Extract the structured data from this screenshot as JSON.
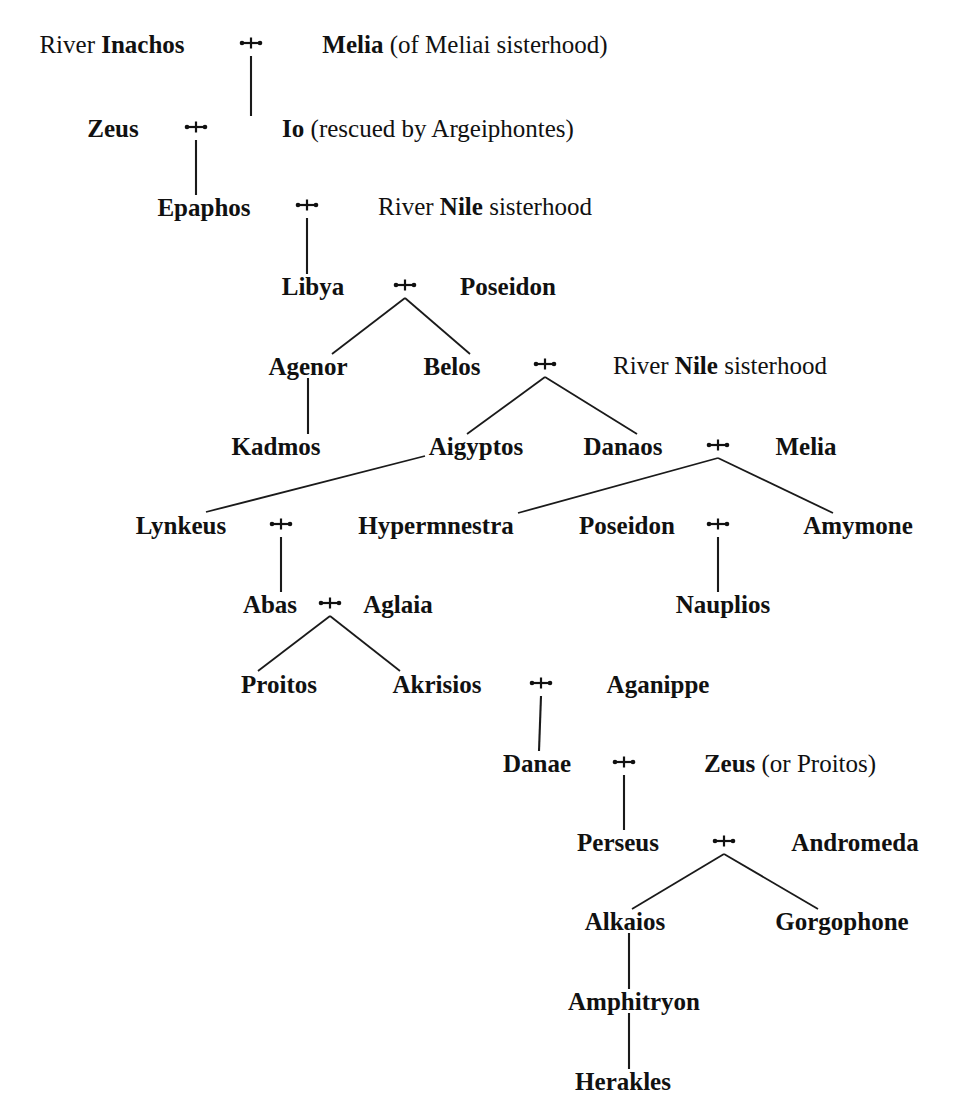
{
  "diagram": {
    "type": "family-tree",
    "marriage_symbol_name": "marriage-union-symbol",
    "ink_color": "#111111",
    "background_color": "#ffffff",
    "line_color": "#1a1a1a",
    "canvas": {
      "width": 962,
      "height": 1115
    }
  },
  "nodes": [
    {
      "id": "inachos",
      "prefix": "River ",
      "name": "Inachos",
      "suffix": "",
      "x": 112,
      "y": 44,
      "size": 25
    },
    {
      "id": "melia1",
      "prefix": "",
      "name": "Melia",
      "suffix": " (of Meliai sisterhood)",
      "x": 465,
      "y": 44,
      "size": 25
    },
    {
      "id": "zeus1",
      "prefix": "",
      "name": "Zeus",
      "suffix": "",
      "x": 113,
      "y": 128,
      "size": 25
    },
    {
      "id": "io",
      "prefix": "",
      "name": "Io",
      "suffix": " (rescued by Argeiphontes)",
      "x": 428,
      "y": 128,
      "size": 25
    },
    {
      "id": "epaphos",
      "prefix": "",
      "name": "Epaphos",
      "suffix": "",
      "x": 204,
      "y": 207,
      "size": 25
    },
    {
      "id": "nile1",
      "prefix": "River ",
      "name": "Nile",
      "suffix": " sisterhood",
      "x": 485,
      "y": 206,
      "size": 25
    },
    {
      "id": "libya",
      "prefix": "",
      "name": "Libya",
      "suffix": "",
      "x": 313,
      "y": 286,
      "size": 25
    },
    {
      "id": "poseidon1",
      "prefix": "",
      "name": "Poseidon",
      "suffix": "",
      "x": 508,
      "y": 286,
      "size": 25
    },
    {
      "id": "agenor",
      "prefix": "",
      "name": "Agenor",
      "suffix": "",
      "x": 308,
      "y": 366,
      "size": 25
    },
    {
      "id": "belos",
      "prefix": "",
      "name": "Belos",
      "suffix": "",
      "x": 452,
      "y": 366,
      "size": 25
    },
    {
      "id": "nile2",
      "prefix": "River ",
      "name": "Nile",
      "suffix": " sisterhood",
      "x": 720,
      "y": 365,
      "size": 25
    },
    {
      "id": "kadmos",
      "prefix": "",
      "name": "Kadmos",
      "suffix": "",
      "x": 276,
      "y": 446,
      "size": 25
    },
    {
      "id": "aigyptos",
      "prefix": "",
      "name": "Aigyptos",
      "suffix": "",
      "x": 476,
      "y": 446,
      "size": 25
    },
    {
      "id": "danaos",
      "prefix": "",
      "name": "Danaos",
      "suffix": "",
      "x": 623,
      "y": 446,
      "size": 25
    },
    {
      "id": "melia2",
      "prefix": "",
      "name": "Melia",
      "suffix": "",
      "x": 806,
      "y": 446,
      "size": 25
    },
    {
      "id": "lynkeus",
      "prefix": "",
      "name": "Lynkeus",
      "suffix": "",
      "x": 181,
      "y": 525,
      "size": 25
    },
    {
      "id": "hypermnestra",
      "prefix": "",
      "name": "Hypermnestra",
      "suffix": "",
      "x": 436,
      "y": 525,
      "size": 25
    },
    {
      "id": "poseidon2",
      "prefix": "",
      "name": "Poseidon",
      "suffix": "",
      "x": 627,
      "y": 525,
      "size": 25
    },
    {
      "id": "amymone",
      "prefix": "",
      "name": "Amymone",
      "suffix": "",
      "x": 858,
      "y": 525,
      "size": 25
    },
    {
      "id": "abas",
      "prefix": "",
      "name": "Abas",
      "suffix": "",
      "x": 270,
      "y": 604,
      "size": 25
    },
    {
      "id": "aglaia",
      "prefix": "",
      "name": "Aglaia",
      "suffix": "",
      "x": 398,
      "y": 604,
      "size": 25
    },
    {
      "id": "nauplios",
      "prefix": "",
      "name": "Nauplios",
      "suffix": "",
      "x": 723,
      "y": 604,
      "size": 25
    },
    {
      "id": "proitos",
      "prefix": "",
      "name": "Proitos",
      "suffix": "",
      "x": 279,
      "y": 684,
      "size": 25
    },
    {
      "id": "akrisios",
      "prefix": "",
      "name": "Akrisios",
      "suffix": "",
      "x": 437,
      "y": 684,
      "size": 25
    },
    {
      "id": "aganippe",
      "prefix": "",
      "name": "Aganippe",
      "suffix": "",
      "x": 658,
      "y": 684,
      "size": 25
    },
    {
      "id": "danae",
      "prefix": "",
      "name": "Danae",
      "suffix": "",
      "x": 537,
      "y": 763,
      "size": 25
    },
    {
      "id": "zeus2",
      "prefix": "",
      "name": "Zeus",
      "suffix": " (or Proitos)",
      "x": 790,
      "y": 763,
      "size": 25
    },
    {
      "id": "perseus",
      "prefix": "",
      "name": "Perseus",
      "suffix": "",
      "x": 618,
      "y": 842,
      "size": 25
    },
    {
      "id": "andromeda",
      "prefix": "",
      "name": "Andromeda",
      "suffix": "",
      "x": 855,
      "y": 842,
      "size": 25
    },
    {
      "id": "alkaios",
      "prefix": "",
      "name": "Alkaios",
      "suffix": "",
      "x": 625,
      "y": 921,
      "size": 25
    },
    {
      "id": "gorgophone",
      "prefix": "",
      "name": "Gorgophone",
      "suffix": "",
      "x": 842,
      "y": 921,
      "size": 25
    },
    {
      "id": "amphitryon",
      "prefix": "",
      "name": "Amphitryon",
      "suffix": "",
      "x": 634,
      "y": 1001,
      "size": 25
    },
    {
      "id": "herakles",
      "prefix": "",
      "name": "Herakles",
      "suffix": "",
      "x": 623,
      "y": 1081,
      "size": 25
    }
  ],
  "unions": [
    {
      "id": "u-inachos-melia",
      "left": "inachos",
      "right": "melia1",
      "x": 251,
      "y": 43
    },
    {
      "id": "u-zeus-io",
      "left": "zeus1",
      "right": "io",
      "x": 196,
      "y": 127
    },
    {
      "id": "u-epaphos-nile",
      "left": "epaphos",
      "right": "nile1",
      "x": 307,
      "y": 205
    },
    {
      "id": "u-libya-poseidon",
      "left": "libya",
      "right": "poseidon1",
      "x": 405,
      "y": 285
    },
    {
      "id": "u-belos-nile",
      "left": "belos",
      "right": "nile2",
      "x": 545,
      "y": 364
    },
    {
      "id": "u-danaos-melia",
      "left": "danaos",
      "right": "melia2",
      "x": 718,
      "y": 445
    },
    {
      "id": "u-lynkeus-hyperm",
      "left": "lynkeus",
      "right": "hypermnestra",
      "x": 281,
      "y": 524
    },
    {
      "id": "u-poseidon-amymone",
      "left": "poseidon2",
      "right": "amymone",
      "x": 718,
      "y": 524
    },
    {
      "id": "u-abas-aglaia",
      "left": "abas",
      "right": "aglaia",
      "x": 330,
      "y": 603
    },
    {
      "id": "u-akrisios-aganip",
      "left": "akrisios",
      "right": "aganippe",
      "x": 541,
      "y": 683
    },
    {
      "id": "u-danae-zeus",
      "left": "danae",
      "right": "zeus2",
      "x": 624,
      "y": 762
    },
    {
      "id": "u-perseus-androm",
      "left": "perseus",
      "right": "andromeda",
      "x": 724,
      "y": 841
    }
  ],
  "edges": [
    {
      "id": "e-inachos-io",
      "from": "u-inachos-melia",
      "to": "io",
      "kind": "vertical",
      "x1": 251,
      "y1": 56,
      "x2": 251,
      "y2": 116
    },
    {
      "id": "e-zeus-epaphos",
      "from": "u-zeus-io",
      "to": "epaphos",
      "kind": "vertical",
      "x1": 196,
      "y1": 140,
      "x2": 196,
      "y2": 195
    },
    {
      "id": "e-epaphos-libya",
      "from": "u-epaphos-nile",
      "to": "libya",
      "kind": "vertical",
      "x1": 307,
      "y1": 218,
      "x2": 307,
      "y2": 274
    },
    {
      "id": "e-libya-agenor",
      "from": "u-libya-poseidon",
      "to": "agenor",
      "kind": "diagonal",
      "x1": 405,
      "y1": 298,
      "x2": 332,
      "y2": 354
    },
    {
      "id": "e-libya-belos",
      "from": "u-libya-poseidon",
      "to": "belos",
      "kind": "diagonal",
      "x1": 405,
      "y1": 298,
      "x2": 470,
      "y2": 354
    },
    {
      "id": "e-agenor-kadmos",
      "from": "agenor",
      "to": "kadmos",
      "kind": "vertical",
      "x1": 308,
      "y1": 378,
      "x2": 308,
      "y2": 434
    },
    {
      "id": "e-belos-aigyptos",
      "from": "u-belos-nile",
      "to": "aigyptos",
      "kind": "diagonal",
      "x1": 545,
      "y1": 377,
      "x2": 467,
      "y2": 434
    },
    {
      "id": "e-belos-danaos",
      "from": "u-belos-nile",
      "to": "danaos",
      "kind": "diagonal",
      "x1": 545,
      "y1": 377,
      "x2": 637,
      "y2": 434
    },
    {
      "id": "e-aigyptos-lynkeus",
      "from": "aigyptos",
      "to": "lynkeus",
      "kind": "diagonal",
      "x1": 425,
      "y1": 456,
      "x2": 206,
      "y2": 512
    },
    {
      "id": "e-danaos-hyperm",
      "from": "u-danaos-melia",
      "to": "hypermnestra",
      "kind": "diagonal",
      "x1": 718,
      "y1": 458,
      "x2": 518,
      "y2": 513
    },
    {
      "id": "e-danaos-amymone",
      "from": "u-danaos-melia",
      "to": "amymone",
      "kind": "diagonal",
      "x1": 718,
      "y1": 458,
      "x2": 833,
      "y2": 513
    },
    {
      "id": "e-lynkeus-abas",
      "from": "u-lynkeus-hyperm",
      "to": "abas",
      "kind": "vertical",
      "x1": 281,
      "y1": 537,
      "x2": 281,
      "y2": 592
    },
    {
      "id": "e-poseidon-nauplios",
      "from": "u-poseidon-amymone",
      "to": "nauplios",
      "kind": "vertical",
      "x1": 718,
      "y1": 537,
      "x2": 718,
      "y2": 592
    },
    {
      "id": "e-abas-proitos",
      "from": "u-abas-aglaia",
      "to": "proitos",
      "kind": "diagonal",
      "x1": 330,
      "y1": 616,
      "x2": 258,
      "y2": 671
    },
    {
      "id": "e-abas-akrisios",
      "from": "u-abas-aglaia",
      "to": "akrisios",
      "kind": "diagonal",
      "x1": 330,
      "y1": 616,
      "x2": 400,
      "y2": 671
    },
    {
      "id": "e-akrisios-danae",
      "from": "u-akrisios-aganip",
      "to": "danae",
      "kind": "vertical",
      "x1": 541,
      "y1": 696,
      "x2": 539,
      "y2": 751
    },
    {
      "id": "e-danae-perseus",
      "from": "u-danae-zeus",
      "to": "perseus",
      "kind": "vertical",
      "x1": 624,
      "y1": 775,
      "x2": 624,
      "y2": 830
    },
    {
      "id": "e-perseus-alkaios",
      "from": "u-perseus-androm",
      "to": "alkaios",
      "kind": "diagonal",
      "x1": 724,
      "y1": 854,
      "x2": 632,
      "y2": 909
    },
    {
      "id": "e-perseus-gorgo",
      "from": "u-perseus-androm",
      "to": "gorgophone",
      "kind": "diagonal",
      "x1": 724,
      "y1": 854,
      "x2": 818,
      "y2": 909
    },
    {
      "id": "e-alkaios-amphi",
      "from": "alkaios",
      "to": "amphitryon",
      "kind": "vertical",
      "x1": 629,
      "y1": 933,
      "x2": 629,
      "y2": 989
    },
    {
      "id": "e-amphi-herakles",
      "from": "amphitryon",
      "to": "herakles",
      "kind": "vertical",
      "x1": 629,
      "y1": 1013,
      "x2": 629,
      "y2": 1069
    }
  ]
}
